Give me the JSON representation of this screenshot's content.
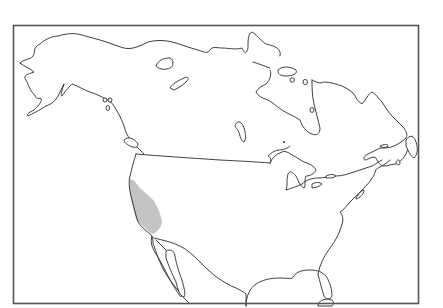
{
  "map": {
    "region": "North America",
    "type": "species range map",
    "frame_color": "#555555",
    "outline_color": "#2a2a2a",
    "background_color": "#ffffff",
    "range": {
      "label": "shaded range",
      "area": "California (west coast, Sierra Nevada to coast)",
      "fill_color": "#c4c4c4"
    }
  }
}
